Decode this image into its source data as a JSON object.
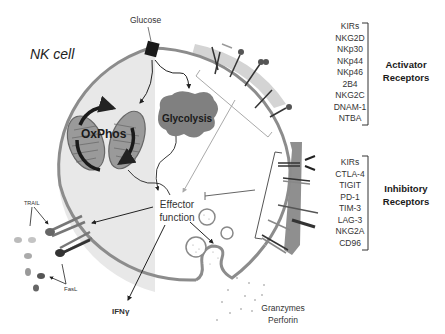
{
  "diagram": {
    "title": "NK cell",
    "glucose_label": "Glucose",
    "oxphos_label": "OxPhos",
    "glycolysis_label": "Glycolysis",
    "effector_label_line1": "Effector",
    "effector_label_line2": "function",
    "ifng_label": "IFNγ",
    "trail_label": "TRAIL",
    "fasl_label": "FasL",
    "granzymes_label": "Granzymes",
    "perforin_label": "Perforin",
    "activator": {
      "title_line1": "Activator",
      "title_line2": "Receptors",
      "items": [
        "KIRs",
        "NKG2D",
        "NKp30",
        "NKp44",
        "NKp46",
        "2B4",
        "NKG2C",
        "DNAM-1",
        "NTBA"
      ]
    },
    "inhibitory": {
      "title_line1": "Inhibitory",
      "title_line2": "Receptors",
      "items": [
        "KIRs",
        "CTLA-4",
        "TIGIT",
        "PD-1",
        "TIM-3",
        "LAG-3",
        "NKG2A",
        "CD96"
      ]
    },
    "colors": {
      "cell_fill_left": "#e6e6e6",
      "cell_fill_right": "#ffffff",
      "membrane": "#8c8c8c",
      "activator_band": "#cfcfcf",
      "inhibitory_band": "#8a8a8a",
      "glycolysis_blob": "#808080",
      "mitochondria": "#9a9a9a",
      "text": "#333333"
    }
  }
}
